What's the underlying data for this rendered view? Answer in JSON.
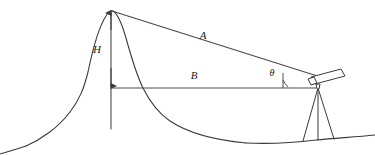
{
  "figure": {
    "background_color": "#ffffff",
    "line_color": "#3a3a3a",
    "label_color": "#1a1a1a",
    "width": 375,
    "height": 155
  },
  "labels": {
    "height": "H",
    "slant_distance": "A",
    "base_distance": "B",
    "elevation_angle": "θ"
  },
  "label_positions": {
    "height": {
      "x": 97,
      "y": 53
    },
    "slant_distance": {
      "x": 203,
      "y": 39
    },
    "base_distance": {
      "x": 194,
      "y": 79
    },
    "elevation_angle": {
      "x": 272,
      "y": 76
    }
  },
  "geometry": {
    "summit": {
      "x": 111,
      "y": 11
    },
    "base_point": {
      "x": 111,
      "y": 88
    },
    "instrument_point": {
      "x": 316,
      "y": 87
    },
    "baseline_y": 88,
    "vertical_axis_bottom": 129,
    "mountain_path": "M 26,146 C 40,140 58,128 70,112 C 80,99 84,88 88,72 C 93,48 98,28 106,16 C 109,11 111,10 113,11 C 118,14 122,24 126,38 C 131,56 136,74 143,88 C 150,102 158,113 170,121 C 188,133 214,140 246,143",
    "valley_path": "M 0,154 C 14,150 20,148 26,146",
    "lower_ground_path": "M 246,143 C 268,144 292,143 316,140 C 336,138 356,137 375,135",
    "tripod": {
      "apex": {
        "x": 318,
        "y": 88
      },
      "legs": [
        {
          "x": 303,
          "y": 141
        },
        {
          "x": 318,
          "y": 140
        },
        {
          "x": 334,
          "y": 139
        }
      ]
    },
    "telescope": {
      "barrel": "M 311,77 L 341,69 L 345,76 L 315,84 Z",
      "eyepiece": "M 308,79 L 314,77 L 317,83 L 311,85 Z",
      "mount": "M 316,84 L 320,84 L 319,89 L 317,89 Z"
    },
    "angle_arc": "M 288,87 A 28 28 0 0 1 283,80",
    "angle_tick": "M 283,73 L 283,88"
  },
  "icons": {
    "theodolite": "theodolite-icon",
    "tripod": "tripod-icon",
    "arrow_up": "arrow-up-icon",
    "arrow_down": "arrow-down-icon"
  }
}
